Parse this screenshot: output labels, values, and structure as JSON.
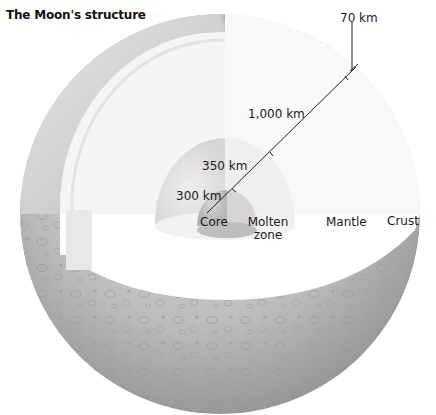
{
  "title": "The Moon's structure",
  "layers": [
    {
      "name": "Core",
      "label": "Core",
      "radius_label": "300 km",
      "color": "#c9c9c9"
    },
    {
      "name": "Molten zone",
      "label_line1": "Molten",
      "label_line2": "zone",
      "radius_label": "350 km",
      "color": "#dcdcdc"
    },
    {
      "name": "Mantle",
      "label": "Mantle",
      "thickness_label": "1,000 km",
      "color": "#f4f4f4"
    },
    {
      "name": "Crust",
      "label": "Crust",
      "thickness_label": "70 km",
      "color": "#bdbdbd"
    }
  ],
  "measurements": {
    "crust": "70 km",
    "mantle": "1,000 km",
    "molten_zone": "350 km",
    "core": "300 km"
  },
  "colors": {
    "surface": "#b8b8b8",
    "surface_dark": "#8e8e8e",
    "cut_plane": "#ffffff",
    "crust_band": "#d0d0d0",
    "leader_line": "#222222"
  }
}
